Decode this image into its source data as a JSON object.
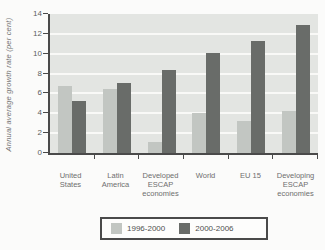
{
  "chart_data": {
    "type": "bar",
    "title": "",
    "ylabel": "Annual average growth rate (per cent)",
    "xlabel": "",
    "ylim": [
      0,
      14
    ],
    "yticks": [
      0,
      2,
      4,
      6,
      8,
      10,
      12,
      14
    ],
    "grid": true,
    "legend_position": "bottom",
    "categories": [
      "United\nStates",
      "Latin\nAmerica",
      "Developed\nESCAP\neconomies",
      "World",
      "EU 15",
      "Developing\nESCAP\neconomies"
    ],
    "series": [
      {
        "name": "1996-2000",
        "color": "#c2c6c2",
        "values": [
          6.8,
          6.4,
          1.1,
          4.0,
          3.2,
          4.2
        ]
      },
      {
        "name": "2000-2006",
        "color": "#696c69",
        "values": [
          5.2,
          7.1,
          8.4,
          10.1,
          11.3,
          12.9
        ]
      }
    ],
    "colors": {
      "plot_background": "#e3e5e2",
      "gridline": "#f9f9f7",
      "axis": "#4a4a4a",
      "tick_text": "#5d5d5d",
      "category_text": "#6e6e6e",
      "legend_border": "#4a4a4a",
      "page_background": "#fbfbfa"
    }
  }
}
